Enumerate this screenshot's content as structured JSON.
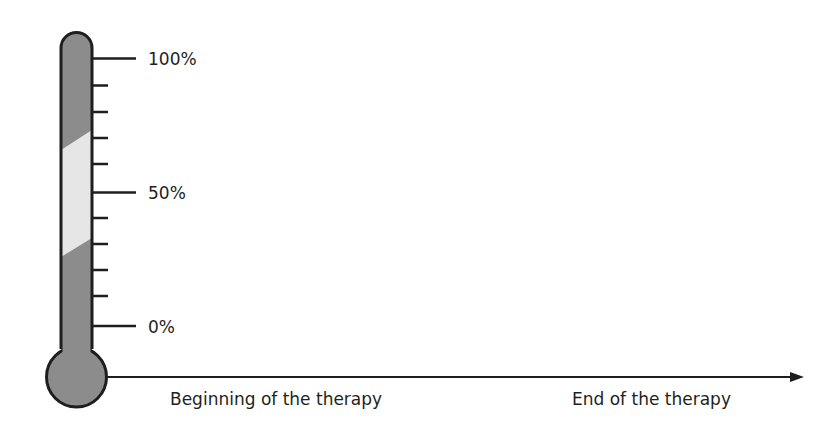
{
  "diagram": {
    "type": "thermometer-timeline",
    "scale_labels": {
      "top": "100%",
      "middle": "50%",
      "bottom": "0%"
    },
    "axis_labels": {
      "start": "Beginning of the therapy",
      "end": "End of the therapy"
    },
    "colors": {
      "outline": "#1e1e1e",
      "fill_dark": "#8c8c8c",
      "fill_light": "#e6e6e6",
      "text": "#231f20"
    },
    "tick_count": 11,
    "highlight_band": {
      "lower_percent_left": 26,
      "upper_percent_left": 67,
      "lower_percent_right": 33,
      "upper_percent_right": 74
    }
  }
}
